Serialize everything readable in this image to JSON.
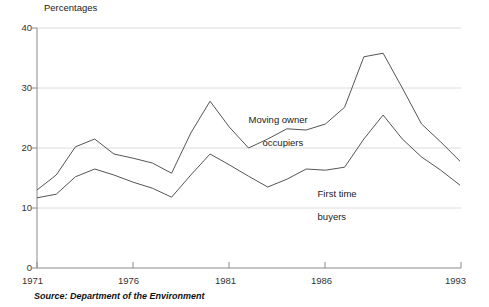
{
  "chart_data": {
    "type": "line",
    "title": "",
    "subtitle": "",
    "ylabel": "Percentages",
    "xlabel": "",
    "ylim": [
      0,
      40
    ],
    "xlim": [
      1971,
      1993
    ],
    "yticks": [
      0,
      10,
      20,
      30,
      40
    ],
    "ytick_labels": [
      "0",
      "10",
      "20",
      "30",
      "40"
    ],
    "xticks": [
      1971,
      1976,
      1981,
      1986,
      1993
    ],
    "xtick_labels": [
      "1971",
      "1976",
      "1981",
      "1986",
      "1993"
    ],
    "grid": "horizontal",
    "legend_position": "inline-annotations",
    "x": [
      1971,
      1972,
      1973,
      1974,
      1975,
      1976,
      1977,
      1978,
      1979,
      1980,
      1981,
      1982,
      1983,
      1984,
      1985,
      1986,
      1987,
      1988,
      1989,
      1990,
      1991,
      1992,
      1993
    ],
    "series": [
      {
        "name": "Moving owner occupiers",
        "label_line1": "Moving owner",
        "label_line2": "occupiers",
        "color": "#555555",
        "values": [
          13.0,
          15.5,
          20.2,
          21.5,
          19.0,
          18.3,
          17.5,
          15.8,
          22.5,
          27.8,
          23.5,
          20.0,
          21.5,
          23.2,
          23.0,
          24.0,
          26.8,
          35.2,
          35.8,
          30.0,
          24.0,
          21.0,
          17.8
        ]
      },
      {
        "name": "First time buyers",
        "label_line1": "First time",
        "label_line2": "buyers",
        "color": "#555555",
        "values": [
          11.7,
          12.3,
          15.2,
          16.5,
          15.5,
          14.3,
          13.3,
          11.8,
          15.5,
          19.0,
          17.2,
          15.3,
          13.5,
          14.8,
          16.5,
          16.3,
          16.8,
          21.5,
          25.5,
          21.5,
          18.5,
          16.3,
          13.8
        ]
      }
    ],
    "annotations": [
      {
        "text": "Moving owner occupiers",
        "x": 1982,
        "y": 26.5
      },
      {
        "text": "First time buyers",
        "x": 1986,
        "y": 14.5
      }
    ]
  },
  "footer": {
    "source": "Source: Department of the Environment"
  },
  "colors": {
    "line": "#555555",
    "grid": "#dcdcdc",
    "axis": "#8a8a8a",
    "text": "#1a1a1a"
  }
}
